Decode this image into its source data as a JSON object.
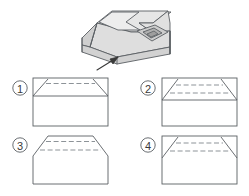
{
  "figure": {
    "type": "orthographic-projection-quiz",
    "background_color": "#ffffff",
    "line_color": "#5a5f63",
    "dashed_line_color": "#8d9398",
    "face_fill_light": "#e9e9e9",
    "face_fill_mid": "#dcdcdc",
    "face_fill_dark": "#c9c9c9",
    "face_fill_darkest": "#b4b4b4",
    "isometric_object": {
      "name": "wedge-block-with-rectangular-notch",
      "description": "Isometric pictorial of a rectangular block with an inclined front face, a notched top-left step and a rectangular recess on the right inclined face"
    },
    "view_arrow": {
      "name": "view-direction-arrow",
      "label": "",
      "direction": "up-right"
    },
    "options": [
      {
        "id": "1",
        "label": "①",
        "shape": "rectangle",
        "description": "Rectangle with short chamfer lines from top corners meeting a full-width horizontal line; one dashed horizontal line near the top"
      },
      {
        "id": "2",
        "label": "②",
        "shape": "rectangle",
        "description": "Rectangle with long chamfer lines from top corners meeting a full-width horizontal line; two dashed horizontal lines inside the trapezoid"
      },
      {
        "id": "3",
        "label": "③",
        "shape": "chamfered-outline",
        "description": "Outline with cut (chamfered) top corners forming an octagon; two dashed horizontal lines near the top"
      },
      {
        "id": "4",
        "label": "④",
        "shape": "rectangle",
        "description": "Rectangle with long chamfer lines from top corners and two dashed horizontal lines; no solid horizontal line beneath them"
      }
    ]
  }
}
